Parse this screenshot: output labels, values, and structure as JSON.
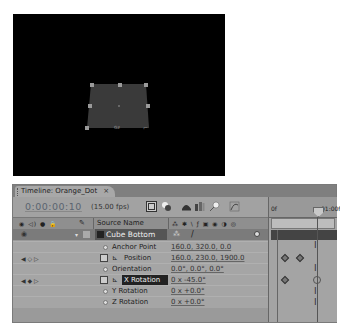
{
  "viewer": {
    "background": "#000000",
    "layer_color": "#3a3a3a",
    "handle_color": "#9a9a9a"
  },
  "panel": {
    "tab": {
      "title": "Timeline: Orange_Dot",
      "close": "×"
    },
    "toolbar": {
      "timecode": "0:00:00:10",
      "fps": "(15.00 fps)",
      "icons": [
        "composition-mini-flowchart-icon",
        "draft-3d-icon",
        "hide-shy-layers-icon",
        "frame-blending-icon",
        "motion-blur-icon",
        "graph-editor-icon"
      ]
    },
    "columns": {
      "av_switches": "◉ ◁) ● 🔒",
      "label_icon": "✎",
      "source_name": "Source Name",
      "switches_icons": "⁂ ✱ \\ ƒ ▣ ◉ ◑ ◎"
    },
    "layer": {
      "name": "Cube Bottom",
      "color": "#555555"
    },
    "properties": [
      {
        "name": "Anchor Point",
        "value": "160.0, 320.0, 0.0",
        "stopwatch": false,
        "keyed": false
      },
      {
        "name": "Position",
        "value": "160.0, 230.0, 1900.0",
        "stopwatch": true,
        "keyed": true
      },
      {
        "name": "Orientation",
        "value": "0.0°, 0.0°, 0.0°",
        "stopwatch": false,
        "keyed": false
      },
      {
        "name": "X Rotation",
        "value": "0 x -45.0°",
        "stopwatch": true,
        "keyed": true,
        "selected": true
      },
      {
        "name": "Y Rotation",
        "value": "0 x +0.0°",
        "stopwatch": false,
        "keyed": false
      },
      {
        "name": "Z Rotation",
        "value": "0 x +0.0°",
        "stopwatch": false,
        "keyed": false
      }
    ],
    "timeline": {
      "ruler_labels": [
        "0f",
        "01:00f"
      ]
    }
  }
}
